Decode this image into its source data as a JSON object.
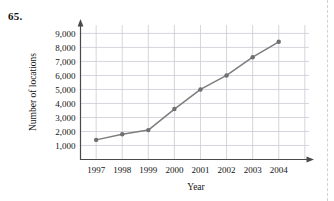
{
  "problem": {
    "number": "65."
  },
  "chart_data": {
    "type": "line",
    "title": "",
    "xlabel": "Year",
    "ylabel": "Number of locations",
    "categories": [
      "1997",
      "1998",
      "1999",
      "2000",
      "2001",
      "2002",
      "2003",
      "2004"
    ],
    "x": [
      1997,
      1998,
      1999,
      2000,
      2001,
      2002,
      2003,
      2004
    ],
    "values": [
      1400,
      1800,
      2100,
      3600,
      5000,
      6000,
      7300,
      8400
    ],
    "series": [
      {
        "name": "Number of locations",
        "values": [
          1400,
          1800,
          2100,
          3600,
          5000,
          6000,
          7300,
          8400
        ]
      }
    ],
    "ytick_labels": [
      "1,000",
      "2,000",
      "3,000",
      "4,000",
      "5,000",
      "6,000",
      "7,000",
      "8,000",
      "9,000"
    ],
    "ytick_values": [
      1000,
      2000,
      3000,
      4000,
      5000,
      6000,
      7000,
      8000,
      9000
    ],
    "xtick_labels": [
      "1997",
      "1998",
      "1999",
      "2000",
      "2001",
      "2002",
      "2003",
      "2004"
    ],
    "ylim": [
      0,
      9600
    ],
    "xlim": [
      1996.4,
      2004.7
    ],
    "grid": true,
    "legend": false,
    "line_color": "#7d7d7d",
    "marker_color": "#6f6f6f",
    "grid_color": "#c9ccd4",
    "axis_color": "#4a4a4a"
  }
}
